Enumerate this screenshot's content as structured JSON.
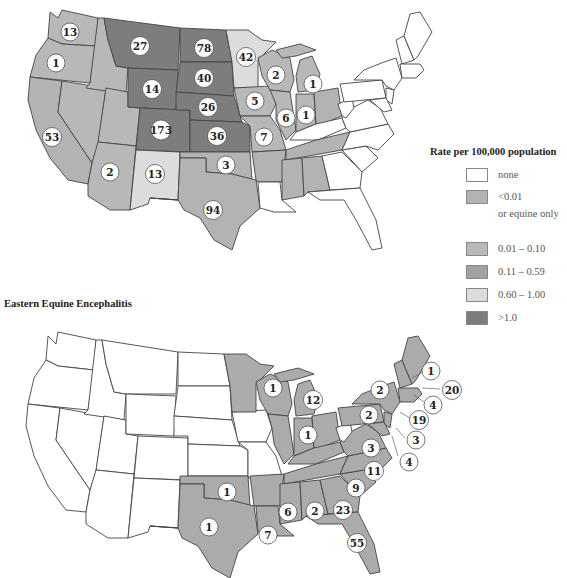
{
  "colors": {
    "none": "#ffffff",
    "lt001": "#b3b3b3",
    "r001_010": "#b8b8b8",
    "r011_059": "#a2a2a2",
    "r060_100": "#dcdcdc",
    "gt1": "#7d7d7d",
    "eee_fill": "#ababab"
  },
  "legend": {
    "title": "Rate per 100,000 population",
    "items": [
      {
        "label": "none",
        "sub": ""
      },
      {
        "label": "<0.01",
        "sub": "or equine only"
      },
      {
        "label": "0.01 – 0.10",
        "sub": ""
      },
      {
        "label": "0.11 – 0.59",
        "sub": ""
      },
      {
        "label": "0.60 – 1.00",
        "sub": ""
      },
      {
        "label": ">1.0",
        "sub": ""
      }
    ]
  },
  "maps": {
    "top": {
      "title": "",
      "case_labels": [
        {
          "state": "WA",
          "value": "13"
        },
        {
          "state": "OR",
          "value": "1"
        },
        {
          "state": "MT",
          "value": "27"
        },
        {
          "state": "ND",
          "value": "78"
        },
        {
          "state": "MN",
          "value": "42"
        },
        {
          "state": "SD",
          "value": "40"
        },
        {
          "state": "WY",
          "value": "14"
        },
        {
          "state": "NE",
          "value": "26"
        },
        {
          "state": "WI",
          "value": "2"
        },
        {
          "state": "MI",
          "value": "1"
        },
        {
          "state": "IA",
          "value": "5"
        },
        {
          "state": "IL",
          "value": "6"
        },
        {
          "state": "IN",
          "value": "1"
        },
        {
          "state": "CA",
          "value": "53"
        },
        {
          "state": "CO",
          "value": "173"
        },
        {
          "state": "KS",
          "value": "36"
        },
        {
          "state": "MO",
          "value": "7"
        },
        {
          "state": "AZ",
          "value": "2"
        },
        {
          "state": "NM",
          "value": "13"
        },
        {
          "state": "OK",
          "value": "3"
        },
        {
          "state": "TX",
          "value": "94"
        }
      ]
    },
    "bottom": {
      "title": "Eastern Equine Encephalitis",
      "case_labels": [
        {
          "state": "WI",
          "value": "1"
        },
        {
          "state": "MI",
          "value": "12"
        },
        {
          "state": "IN",
          "value": "1"
        },
        {
          "state": "NY",
          "value": "2"
        },
        {
          "state": "PA",
          "value": "2"
        },
        {
          "state": "NH",
          "value": "1"
        },
        {
          "state": "MA",
          "value": "20"
        },
        {
          "state": "RI",
          "value": "4"
        },
        {
          "state": "NJ",
          "value": "19"
        },
        {
          "state": "DE",
          "value": "3"
        },
        {
          "state": "MD",
          "value": "4"
        },
        {
          "state": "VA",
          "value": "3"
        },
        {
          "state": "NC",
          "value": "11"
        },
        {
          "state": "SC",
          "value": "9"
        },
        {
          "state": "OK",
          "value": "1"
        },
        {
          "state": "TX",
          "value": "1"
        },
        {
          "state": "MS",
          "value": "6"
        },
        {
          "state": "AL",
          "value": "2"
        },
        {
          "state": "GA",
          "value": "23"
        },
        {
          "state": "LA",
          "value": "7"
        },
        {
          "state": "FL",
          "value": "55"
        }
      ]
    }
  }
}
